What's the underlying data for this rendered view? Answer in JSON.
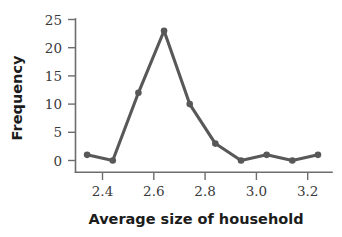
{
  "chart_data": {
    "type": "line",
    "title": "",
    "subtitle": "",
    "xlabel": "Average size of household",
    "ylabel": "Frequency",
    "xlim": [
      2.29,
      3.29
    ],
    "ylim": [
      0,
      25
    ],
    "xticks": [
      2.4,
      2.6,
      2.8,
      3.0,
      3.2
    ],
    "xtick_labels": [
      "2.4",
      "2.6",
      "2.8",
      "3.0",
      "3.2"
    ],
    "yticks": [
      0,
      5,
      10,
      15,
      20,
      25
    ],
    "ytick_labels": [
      "0",
      "5",
      "10",
      "15",
      "20",
      "25"
    ],
    "grid": false,
    "legend": "none",
    "series": [
      {
        "name": "Frequency",
        "color": "#585858",
        "marker": "circle",
        "x": [
          2.34,
          2.44,
          2.54,
          2.64,
          2.74,
          2.84,
          2.94,
          3.04,
          3.14,
          3.24
        ],
        "values": [
          1,
          0,
          12,
          23,
          10,
          3,
          0,
          1,
          0,
          1
        ]
      }
    ]
  },
  "figure": {
    "xlabel": "Average size of household",
    "ylabel": "Frequency"
  }
}
